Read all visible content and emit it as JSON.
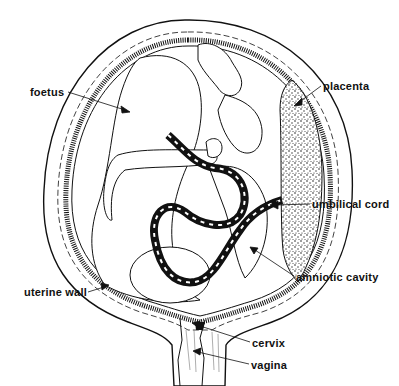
{
  "diagram": {
    "colors": {
      "ink": "#111111",
      "background": "#ffffff"
    },
    "labels": [
      {
        "id": "foetus",
        "text": "foetus",
        "x": 30,
        "y": 86
      },
      {
        "id": "placenta",
        "text": "placenta",
        "x": 323,
        "y": 80
      },
      {
        "id": "umbilical-cord",
        "text": "umbilical cord",
        "x": 312,
        "y": 198
      },
      {
        "id": "amniotic-cavity",
        "text": "amniotic cavity",
        "x": 296,
        "y": 271
      },
      {
        "id": "uterine-wall",
        "text": "uterine wall",
        "x": 24,
        "y": 286
      },
      {
        "id": "cervix",
        "text": "cervix",
        "x": 252,
        "y": 337
      },
      {
        "id": "vagina",
        "text": "vagina",
        "x": 251,
        "y": 359
      }
    ]
  }
}
